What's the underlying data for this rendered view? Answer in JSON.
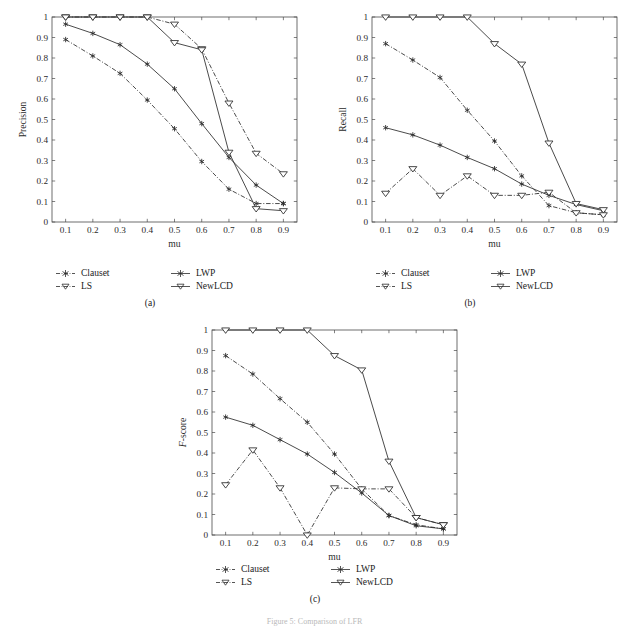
{
  "figure": {
    "caption": "Figure 5: Comparison of LFR",
    "panels": [
      {
        "key": "a",
        "tag": "(a)"
      },
      {
        "key": "b",
        "tag": "(b)"
      },
      {
        "key": "c",
        "tag": "(c)"
      }
    ]
  },
  "legend": {
    "entries": [
      {
        "label": "Clauset",
        "marker": "asterisk",
        "line": "dashdot",
        "color": "#2a2a2a"
      },
      {
        "label": "LWP",
        "marker": "asterisk",
        "line": "solid",
        "color": "#2a2a2a"
      },
      {
        "label": "LS",
        "marker": "triangle-down",
        "line": "dashdot",
        "color": "#2a2a2a"
      },
      {
        "label": "NewLCD",
        "marker": "triangle-down",
        "line": "solid",
        "color": "#2a2a2a"
      }
    ]
  },
  "chart_data": [
    {
      "type": "line",
      "panel": "(a)",
      "title": "",
      "xlabel": "mu",
      "ylabel": "Precision",
      "x": [
        0.1,
        0.2,
        0.3,
        0.4,
        0.5,
        0.6,
        0.7,
        0.8,
        0.9
      ],
      "xticklabels": [
        "0.1",
        "0.2",
        "0.3",
        "0.4",
        "0.5",
        "0.6",
        "0.7",
        "0.8",
        "0.9"
      ],
      "yticklabels": [
        "0",
        "0.1",
        "0.2",
        "0.3",
        "0.4",
        "0.5",
        "0.6",
        "0.7",
        "0.8",
        "0.9",
        "1"
      ],
      "xlim": [
        0.05,
        0.95
      ],
      "ylim": [
        0,
        1
      ],
      "grid": false,
      "legend_position": "below",
      "series": [
        {
          "name": "Clauset",
          "marker": "asterisk",
          "line": "dashdot",
          "values": [
            0.89,
            0.81,
            0.725,
            0.595,
            0.455,
            0.295,
            0.16,
            0.09,
            0.09
          ]
        },
        {
          "name": "LWP",
          "marker": "asterisk",
          "line": "solid",
          "values": [
            0.965,
            0.92,
            0.865,
            0.77,
            0.65,
            0.48,
            0.315,
            0.18,
            0.09
          ]
        },
        {
          "name": "LS",
          "marker": "triangle-down",
          "line": "dashdot",
          "values": [
            1.0,
            1.0,
            1.0,
            1.0,
            0.965,
            0.845,
            0.58,
            0.335,
            0.235
          ]
        },
        {
          "name": "NewLCD",
          "marker": "triangle-down",
          "line": "solid",
          "values": [
            1.0,
            1.0,
            1.0,
            1.0,
            0.875,
            0.84,
            0.34,
            0.065,
            0.055
          ]
        }
      ]
    },
    {
      "type": "line",
      "panel": "(b)",
      "title": "",
      "xlabel": "mu",
      "ylabel": "Recall",
      "x": [
        0.1,
        0.2,
        0.3,
        0.4,
        0.5,
        0.6,
        0.7,
        0.8,
        0.9
      ],
      "xticklabels": [
        "0.1",
        "0.2",
        "0.3",
        "0.4",
        "0.5",
        "0.6",
        "0.7",
        "0.8",
        "0.9"
      ],
      "yticklabels": [
        "0",
        "0.1",
        "0.2",
        "0.3",
        "0.4",
        "0.5",
        "0.6",
        "0.7",
        "0.8",
        "0.9",
        "1"
      ],
      "xlim": [
        0.05,
        0.95
      ],
      "ylim": [
        0,
        1
      ],
      "grid": false,
      "legend_position": "below",
      "series": [
        {
          "name": "Clauset",
          "marker": "asterisk",
          "line": "dashdot",
          "values": [
            0.87,
            0.79,
            0.705,
            0.545,
            0.395,
            0.225,
            0.08,
            0.045,
            0.035
          ]
        },
        {
          "name": "LWP",
          "marker": "asterisk",
          "line": "solid",
          "values": [
            0.46,
            0.425,
            0.375,
            0.315,
            0.26,
            0.185,
            0.13,
            0.085,
            0.055
          ]
        },
        {
          "name": "LS",
          "marker": "triangle-down",
          "line": "dashdot",
          "values": [
            0.14,
            0.26,
            0.13,
            0.225,
            0.13,
            0.13,
            0.145,
            0.045,
            0.035
          ]
        },
        {
          "name": "NewLCD",
          "marker": "triangle-down",
          "line": "solid",
          "values": [
            1.0,
            1.0,
            1.0,
            1.0,
            0.87,
            0.77,
            0.385,
            0.09,
            0.06
          ]
        }
      ]
    },
    {
      "type": "line",
      "panel": "(c)",
      "title": "",
      "xlabel": "mu",
      "ylabel": "F-score",
      "x": [
        0.1,
        0.2,
        0.3,
        0.4,
        0.5,
        0.6,
        0.7,
        0.8,
        0.9
      ],
      "xticklabels": [
        "0.1",
        "0.2",
        "0.3",
        "0.4",
        "0.5",
        "0.6",
        "0.7",
        "0.8",
        "0.9"
      ],
      "yticklabels": [
        "0",
        "0.1",
        "0.2",
        "0.3",
        "0.4",
        "0.5",
        "0.6",
        "0.7",
        "0.8",
        "0.9",
        "1"
      ],
      "xlim": [
        0.05,
        0.95
      ],
      "ylim": [
        0,
        1
      ],
      "grid": false,
      "legend_position": "below",
      "series": [
        {
          "name": "Clauset",
          "marker": "asterisk",
          "line": "dashdot",
          "values": [
            0.875,
            0.785,
            0.665,
            0.55,
            0.395,
            0.225,
            0.095,
            0.05,
            0.03
          ]
        },
        {
          "name": "LWP",
          "marker": "asterisk",
          "line": "solid",
          "values": [
            0.575,
            0.535,
            0.465,
            0.395,
            0.305,
            0.205,
            0.095,
            0.045,
            0.03
          ]
        },
        {
          "name": "LS",
          "marker": "triangle-down",
          "line": "dashdot",
          "values": [
            0.245,
            0.415,
            0.23,
            0.0,
            0.23,
            0.225,
            0.225,
            0.085,
            0.05
          ]
        },
        {
          "name": "NewLCD",
          "marker": "triangle-down",
          "line": "solid",
          "values": [
            1.0,
            1.0,
            1.0,
            1.0,
            0.875,
            0.805,
            0.36,
            0.085,
            0.05
          ]
        }
      ]
    }
  ]
}
